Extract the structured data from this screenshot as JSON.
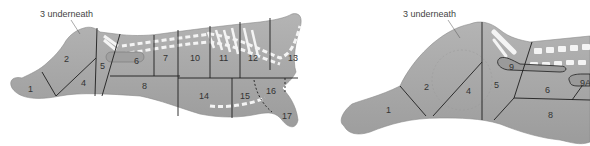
{
  "colors": {
    "body": "#a8a8a8",
    "body_dark": "#9a9a9a",
    "outline": "#1e1e1e",
    "fat": "#f4f4f4",
    "label": "#333333",
    "background": "#ffffff"
  },
  "left_diagram": {
    "note": "3 underneath",
    "labels": [
      "1",
      "2",
      "4",
      "5",
      "6",
      "7",
      "8",
      "10",
      "11",
      "12",
      "13",
      "14",
      "15",
      "16",
      "17"
    ]
  },
  "right_diagram": {
    "note": "3 underneath",
    "labels": [
      "1",
      "2",
      "4",
      "5",
      "6",
      "8",
      "9",
      "9A"
    ]
  }
}
